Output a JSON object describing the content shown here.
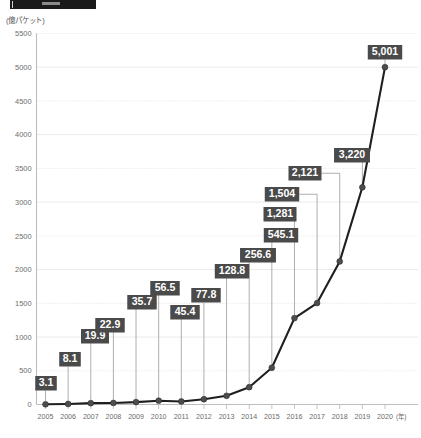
{
  "header": {
    "title_bar_present": true,
    "accent_color": "#1a1a1a"
  },
  "axis": {
    "y_unit_label": "(億パケット)",
    "x_unit_label": "(年)"
  },
  "colors": {
    "label_box": "#4a4a4a",
    "label_text": "#ffffff",
    "line": "#1f1f1f",
    "marker": "#4d4d4d",
    "grid": "#e6e6e6",
    "axis": "#bdbdbd",
    "tick_text": "#6b6b6b"
  },
  "chart_data": {
    "type": "line",
    "title": "",
    "subtitle": "",
    "xlabel": "(年)",
    "ylabel": "(億パケット)",
    "ylim": [
      0,
      5500
    ],
    "yticks": [
      0,
      500,
      1000,
      1500,
      2000,
      2500,
      3000,
      3500,
      4000,
      4500,
      5000,
      5500
    ],
    "ytick_labels": [
      "0",
      "500",
      "1000",
      "1500",
      "2000",
      "2500",
      "3000",
      "3500",
      "4000",
      "4500",
      "5000",
      "5500"
    ],
    "grid": true,
    "legend": false,
    "categories": [
      "2005",
      "2006",
      "2007",
      "2008",
      "2009",
      "2010",
      "2011",
      "2012",
      "2013",
      "2014",
      "2015",
      "2016",
      "2017",
      "2018",
      "2019",
      "2020"
    ],
    "x": [
      2005,
      2006,
      2007,
      2008,
      2009,
      2010,
      2011,
      2012,
      2013,
      2014,
      2015,
      2016,
      2017,
      2018,
      2019,
      2020
    ],
    "values": [
      3.1,
      8.1,
      19.9,
      22.9,
      35.7,
      56.5,
      45.4,
      77.8,
      128.8,
      256.6,
      545.1,
      1281,
      1504,
      2121,
      3220,
      5001
    ],
    "data_labels": [
      "3.1",
      "8.1",
      "19.9",
      "22.9",
      "35.7",
      "56.5",
      "45.4",
      "77.8",
      "128.8",
      "256.6",
      "545.1",
      "1,281",
      "1,504",
      "2,121",
      "3,220",
      "5,001"
    ],
    "xtick_labels": [
      "2005",
      "2006",
      "2007",
      "2008",
      "2009",
      "2010",
      "2011",
      "2012",
      "2013",
      "2014",
      "2015",
      "2016",
      "2017",
      "2018",
      "2019",
      "2020"
    ]
  }
}
